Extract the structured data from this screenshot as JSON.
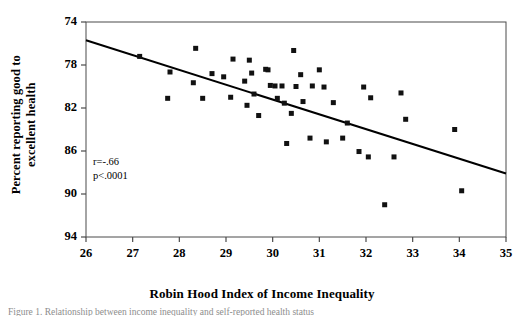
{
  "figure": {
    "caption_partial": "Figure 1. Relationship between income inequality and self-reported health status"
  },
  "chart_data": {
    "type": "scatter",
    "title": "",
    "xlabel": "Robin Hood Index of Income Inequality",
    "ylabel_line1": "Percent reporting good to",
    "ylabel_line2": "excellent health",
    "xlim": [
      26,
      35
    ],
    "ylim": [
      74,
      94
    ],
    "xticks": [
      26,
      27,
      28,
      29,
      30,
      31,
      32,
      33,
      34,
      35
    ],
    "yticks": [
      74,
      78,
      82,
      86,
      90,
      94
    ],
    "grid": false,
    "legend": null,
    "marker": "square",
    "marker_color": "#111111",
    "annotations": [
      {
        "text": "r=-.66",
        "x": 26.15,
        "y": 80.9
      },
      {
        "text": "p<.0001",
        "x": 26.15,
        "y": 79.6
      }
    ],
    "trendline": {
      "type": "linear",
      "x_start": 26.0,
      "y_start": 92.3,
      "x_end": 35.0,
      "y_end": 79.9,
      "slope": -1.378,
      "intercept": 128.1,
      "color": "#000000"
    },
    "points": [
      {
        "x": 27.15,
        "y": 90.8
      },
      {
        "x": 27.75,
        "y": 86.9
      },
      {
        "x": 27.8,
        "y": 89.35
      },
      {
        "x": 28.3,
        "y": 88.35
      },
      {
        "x": 28.35,
        "y": 91.55
      },
      {
        "x": 28.5,
        "y": 86.9
      },
      {
        "x": 28.7,
        "y": 89.2
      },
      {
        "x": 28.95,
        "y": 88.9
      },
      {
        "x": 29.1,
        "y": 87.0
      },
      {
        "x": 29.15,
        "y": 90.55
      },
      {
        "x": 29.4,
        "y": 88.5
      },
      {
        "x": 29.45,
        "y": 86.25
      },
      {
        "x": 29.5,
        "y": 90.45
      },
      {
        "x": 29.55,
        "y": 89.25
      },
      {
        "x": 29.6,
        "y": 87.3
      },
      {
        "x": 29.7,
        "y": 85.3
      },
      {
        "x": 29.85,
        "y": 89.6
      },
      {
        "x": 29.9,
        "y": 89.55
      },
      {
        "x": 29.95,
        "y": 88.1
      },
      {
        "x": 30.05,
        "y": 88.05
      },
      {
        "x": 30.1,
        "y": 86.9
      },
      {
        "x": 30.2,
        "y": 88.05
      },
      {
        "x": 30.25,
        "y": 86.45
      },
      {
        "x": 30.3,
        "y": 82.7
      },
      {
        "x": 30.4,
        "y": 85.5
      },
      {
        "x": 30.45,
        "y": 91.35
      },
      {
        "x": 30.5,
        "y": 88.0
      },
      {
        "x": 30.6,
        "y": 89.1
      },
      {
        "x": 30.65,
        "y": 86.6
      },
      {
        "x": 30.8,
        "y": 83.2
      },
      {
        "x": 30.85,
        "y": 88.05
      },
      {
        "x": 31.0,
        "y": 89.55
      },
      {
        "x": 31.1,
        "y": 87.95
      },
      {
        "x": 31.15,
        "y": 82.85
      },
      {
        "x": 31.3,
        "y": 86.5
      },
      {
        "x": 31.5,
        "y": 83.2
      },
      {
        "x": 31.6,
        "y": 84.6
      },
      {
        "x": 31.85,
        "y": 81.95
      },
      {
        "x": 31.95,
        "y": 87.95
      },
      {
        "x": 32.05,
        "y": 81.45
      },
      {
        "x": 32.1,
        "y": 86.95
      },
      {
        "x": 32.4,
        "y": 77.0
      },
      {
        "x": 32.6,
        "y": 81.45
      },
      {
        "x": 32.75,
        "y": 87.4
      },
      {
        "x": 32.85,
        "y": 84.95
      },
      {
        "x": 33.9,
        "y": 84.0
      },
      {
        "x": 34.05,
        "y": 78.3
      }
    ]
  },
  "axes": {
    "ytick_labels": [
      "94",
      "90",
      "86",
      "82",
      "78",
      "74"
    ],
    "xtick_labels": [
      "26",
      "27",
      "28",
      "29",
      "30",
      "31",
      "32",
      "33",
      "34",
      "35"
    ]
  }
}
